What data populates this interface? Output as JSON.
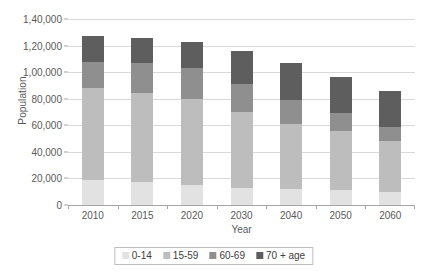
{
  "chart_data": {
    "type": "bar",
    "stacked": true,
    "title": "",
    "xlabel": "Year",
    "ylabel": "Population",
    "categories": [
      "2010",
      "2015",
      "2020",
      "2030",
      "2040",
      "2050",
      "2060"
    ],
    "series": [
      {
        "name": "0-14",
        "color": "#e2e2e2",
        "values": [
          19000,
          17000,
          15000,
          13000,
          12000,
          11000,
          10000
        ]
      },
      {
        "name": "15-59",
        "color": "#bdbdbd",
        "values": [
          69000,
          67000,
          65000,
          57000,
          49000,
          45000,
          38000
        ]
      },
      {
        "name": "60-69",
        "color": "#8f8f8f",
        "values": [
          20000,
          23000,
          23000,
          21000,
          18000,
          13000,
          11000
        ]
      },
      {
        "name": "70 + age",
        "color": "#5e5e5e",
        "values": [
          19000,
          19000,
          20000,
          25000,
          28000,
          27000,
          27000
        ]
      }
    ],
    "totals": [
      127000,
      126000,
      123000,
      116000,
      107000,
      96000,
      86000
    ],
    "ylim": [
      0,
      140000
    ],
    "ytick_values": [
      0,
      20000,
      40000,
      60000,
      80000,
      100000,
      120000,
      140000
    ],
    "ytick_labels": [
      "0",
      "20,000",
      "40,000",
      "60,000",
      "80,000",
      "1,00,000",
      "1,20,000",
      "1,40,000"
    ],
    "grid": true,
    "legend_position": "bottom",
    "legend_entries": [
      "0-14",
      "15-59",
      "60-69",
      "70 + age"
    ]
  },
  "axes": {
    "y_title": "Population",
    "x_title": "Year"
  },
  "colors": {
    "gridline": "#d9d9d9",
    "axis": "#a6a6a6",
    "text": "#595959",
    "background": "#ffffff",
    "legend_border": "#bfbfbf"
  }
}
